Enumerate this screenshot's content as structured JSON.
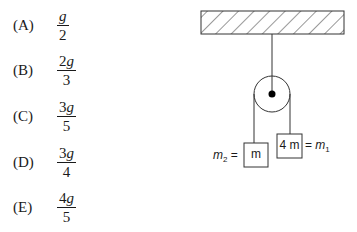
{
  "choices": [
    {
      "letter": "(A)",
      "numerator_coef": "",
      "numerator_var": "g",
      "denominator": "2"
    },
    {
      "letter": "(B)",
      "numerator_coef": "2",
      "numerator_var": "g",
      "denominator": "3"
    },
    {
      "letter": "(C)",
      "numerator_coef": "3",
      "numerator_var": "g",
      "denominator": "5"
    },
    {
      "letter": "(D)",
      "numerator_coef": "3",
      "numerator_var": "g",
      "denominator": "4"
    },
    {
      "letter": "(E)",
      "numerator_coef": "4",
      "numerator_var": "g",
      "denominator": "5"
    }
  ],
  "diagram": {
    "left_mass_label_var": "m",
    "left_mass_label_sub": "2",
    "left_mass_label_eq": "=",
    "left_block_text": "m",
    "right_block_text": "4 m",
    "right_mass_label_eq": "=",
    "right_mass_label_var": "m",
    "right_mass_label_sub": "1"
  }
}
